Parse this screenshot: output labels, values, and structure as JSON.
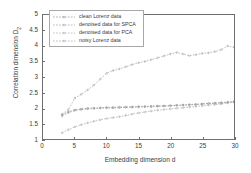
{
  "chart_data": {
    "type": "line",
    "title": "",
    "xlabel": "Embedding dimension d",
    "ylabel": "Correlation dimension D",
    "ylabel_sub": "2",
    "xlim": [
      0,
      30
    ],
    "ylim": [
      1,
      5
    ],
    "xticks": [
      0,
      5,
      10,
      15,
      20,
      25,
      30
    ],
    "yticks": [
      "1",
      "1.5",
      "2",
      "2.5",
      "3",
      "3.5",
      "4",
      "4.5",
      "5"
    ],
    "grid": false,
    "legend_position": "upper-left",
    "x": [
      3,
      4,
      5,
      6,
      7,
      8,
      9,
      10,
      11,
      12,
      13,
      14,
      15,
      16,
      17,
      18,
      19,
      20,
      21,
      22,
      23,
      24,
      25,
      26,
      27,
      28,
      29,
      30
    ],
    "series": [
      {
        "name": "clean Lorenz data",
        "marker": "dotted-line",
        "color": "#8a8a8a",
        "values": [
          1.78,
          1.88,
          1.94,
          1.97,
          1.99,
          2.0,
          2.01,
          2.02,
          2.02,
          2.03,
          2.03,
          2.04,
          2.05,
          2.05,
          2.06,
          2.07,
          2.07,
          2.08,
          2.09,
          2.1,
          2.11,
          2.12,
          2.13,
          2.15,
          2.16,
          2.17,
          2.19,
          2.2
        ]
      },
      {
        "name": "denoised data for SPCA",
        "marker": "dotted-line",
        "color": "#9a9a9a",
        "values": [
          1.74,
          1.85,
          1.92,
          1.95,
          1.97,
          1.98,
          1.99,
          2.0,
          2.0,
          2.01,
          2.02,
          2.02,
          2.03,
          2.04,
          2.04,
          2.05,
          2.06,
          2.07,
          2.08,
          2.09,
          2.1,
          2.11,
          2.13,
          2.14,
          2.15,
          2.17,
          2.18,
          2.19
        ]
      },
      {
        "name": "denoised data for PCA",
        "marker": "dotted-line",
        "color": "#a5a5a5",
        "values": [
          1.2,
          1.3,
          1.39,
          1.46,
          1.52,
          1.57,
          1.62,
          1.66,
          1.69,
          1.72,
          1.76,
          1.8,
          1.84,
          1.87,
          1.9,
          1.93,
          1.95,
          1.97,
          1.99,
          2.01,
          2.03,
          2.05,
          2.07,
          2.09,
          2.11,
          2.13,
          2.16,
          2.22
        ]
      },
      {
        "name": "noisy  Lorenz data",
        "marker": "dotted-line",
        "color": "#9f9f9f",
        "values": [
          1.8,
          1.95,
          2.32,
          2.44,
          2.58,
          2.74,
          2.93,
          3.12,
          3.21,
          3.26,
          3.33,
          3.4,
          3.46,
          3.5,
          3.56,
          3.62,
          3.68,
          3.74,
          3.79,
          3.74,
          3.69,
          3.72,
          3.76,
          3.78,
          3.82,
          3.88,
          4.0,
          3.96
        ]
      }
    ]
  },
  "axis": {
    "ylabel_text": "Correlation dimension D",
    "ylabel_subscript": "2",
    "xlabel_text": "Embedding dimension d"
  },
  "legend": {
    "entries": [
      {
        "label": "clean Lorenz data"
      },
      {
        "label": "denoised data for SPCA"
      },
      {
        "label": "denoised data for PCA"
      },
      {
        "label": "noisy  Lorenz data"
      }
    ]
  }
}
